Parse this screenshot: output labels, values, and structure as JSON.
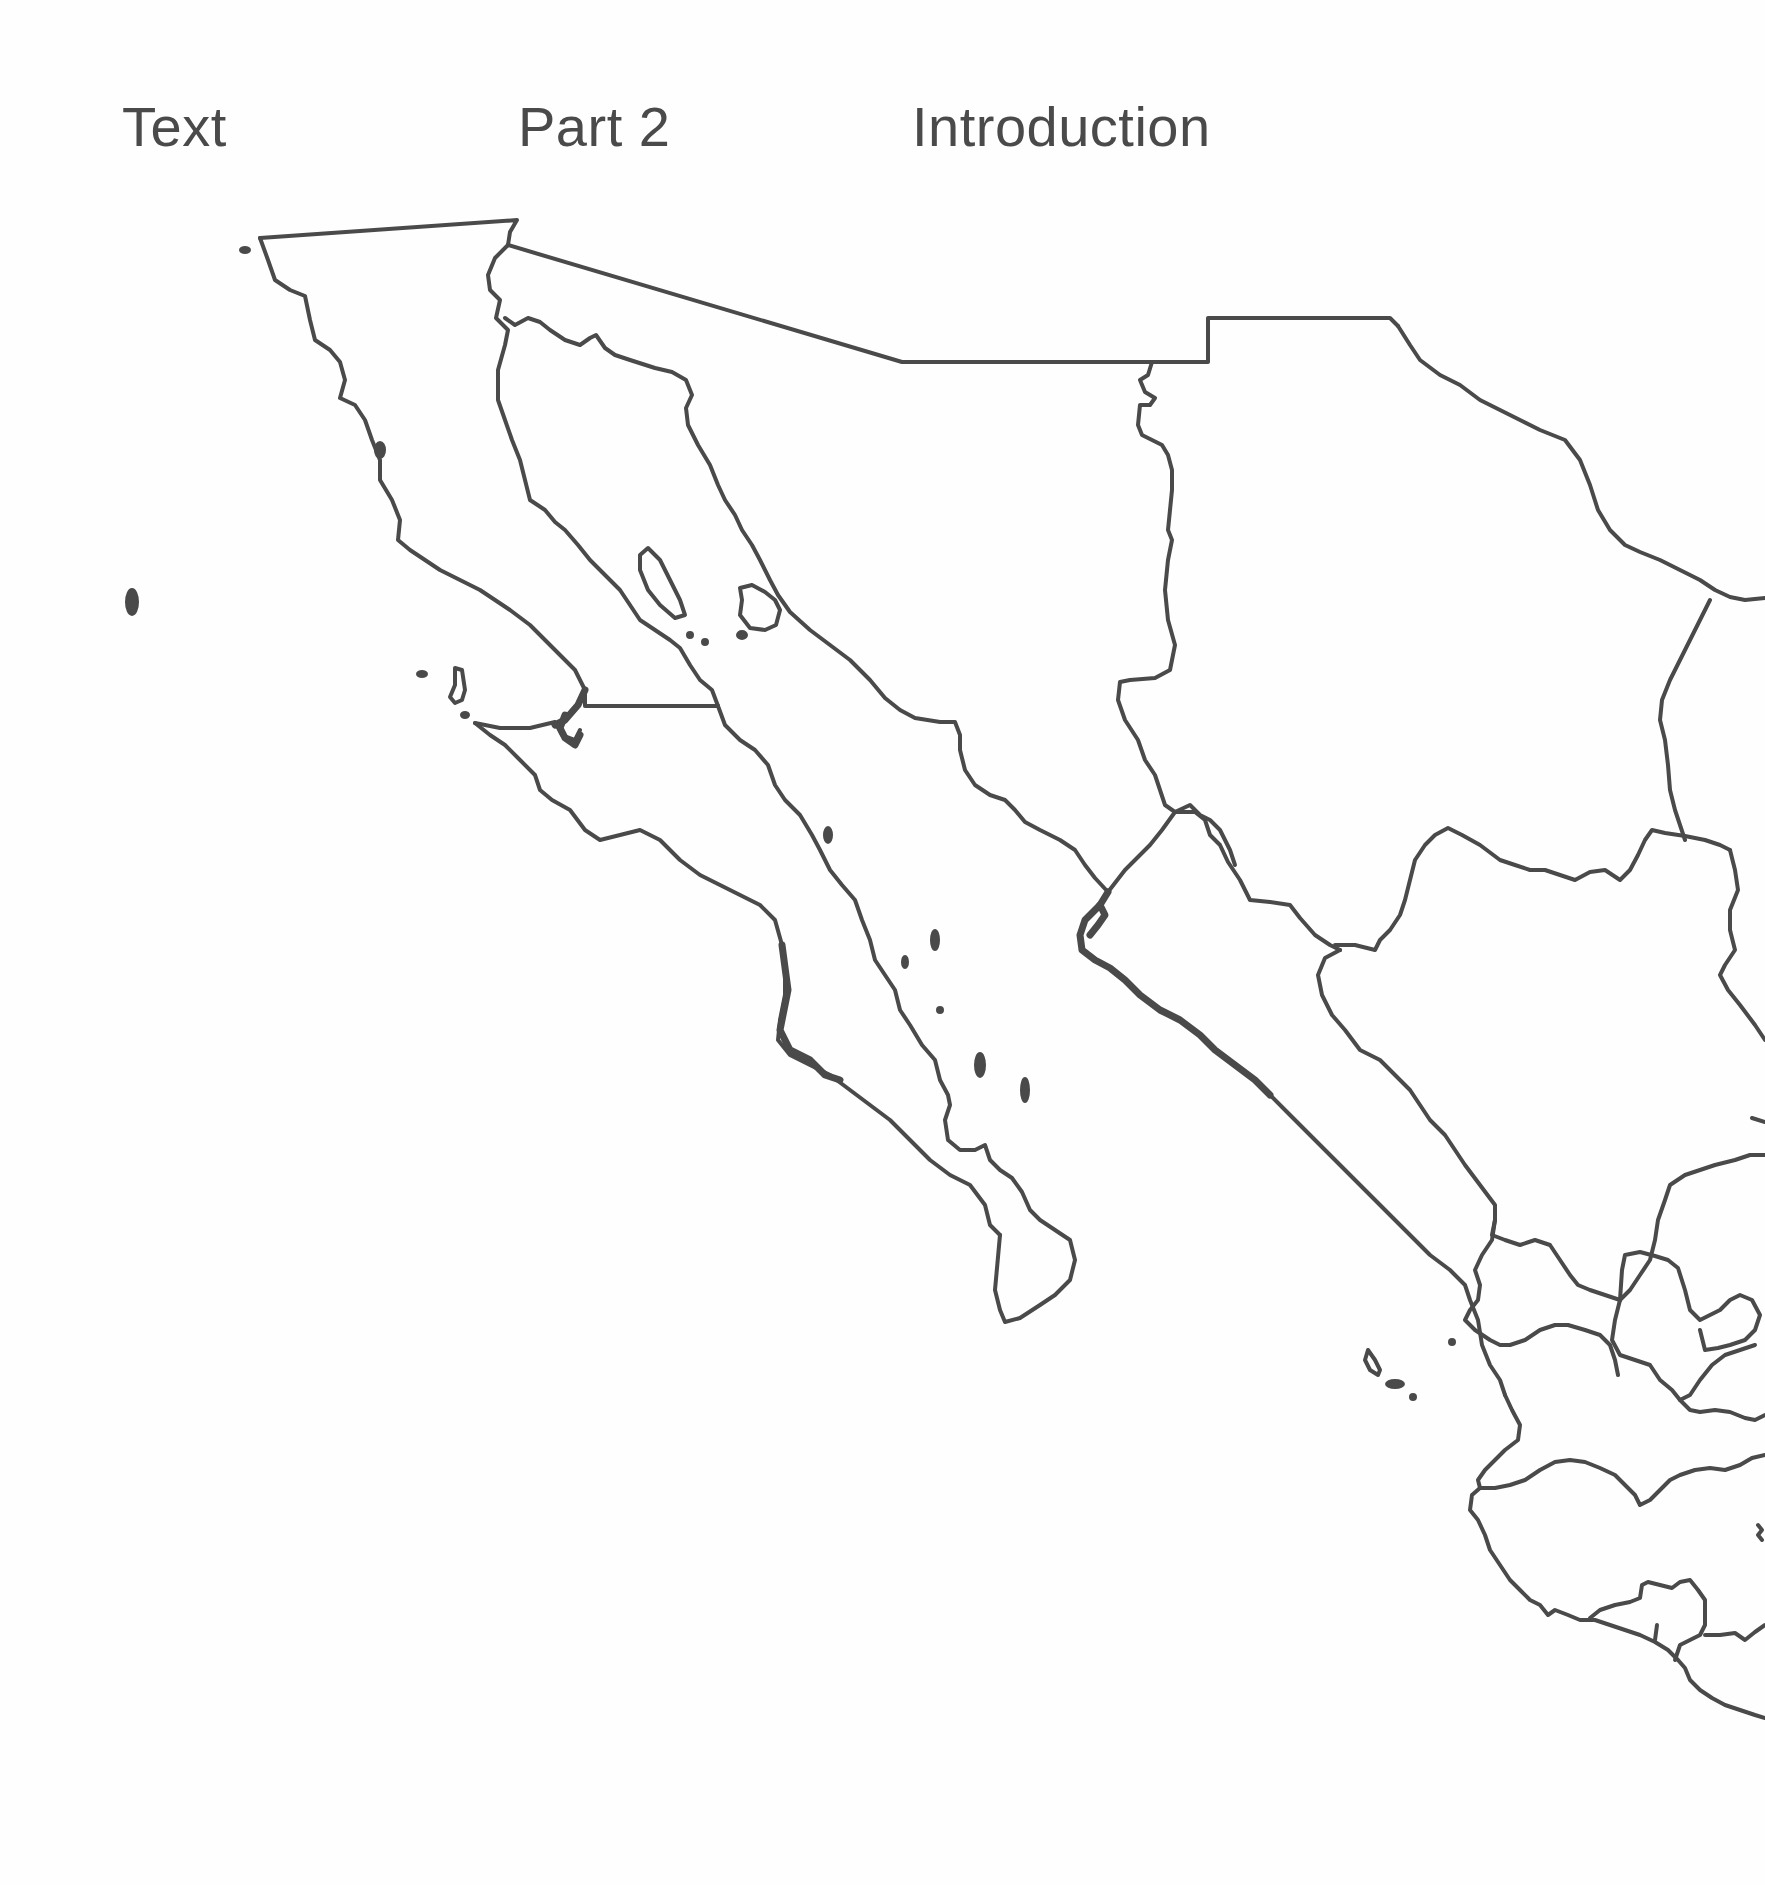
{
  "running_header": {
    "section": "Text",
    "part": "Part 2",
    "chapter": "Introduction"
  },
  "map": {
    "type": "outline-map",
    "region": "Northwestern Mexico",
    "line_color": "#4a4a4a",
    "background_color": "#ffffff",
    "features": [
      {
        "name": "baja-california",
        "kind": "state-outline"
      },
      {
        "name": "baja-california-sur",
        "kind": "state-outline"
      },
      {
        "name": "sonora",
        "kind": "state-outline"
      },
      {
        "name": "chihuahua",
        "kind": "state-outline"
      },
      {
        "name": "coahuila",
        "kind": "state-outline"
      },
      {
        "name": "sinaloa",
        "kind": "state-outline"
      },
      {
        "name": "durango",
        "kind": "state-outline"
      },
      {
        "name": "nayarit",
        "kind": "state-outline"
      },
      {
        "name": "zacatecas",
        "kind": "state-outline"
      },
      {
        "name": "jalisco",
        "kind": "state-outline"
      },
      {
        "name": "aguascalientes",
        "kind": "state-outline"
      },
      {
        "name": "colima",
        "kind": "state-outline"
      },
      {
        "name": "michoacan",
        "kind": "state-outline"
      },
      {
        "name": "us-border",
        "kind": "international-border"
      },
      {
        "name": "pacific-islands",
        "kind": "islands"
      },
      {
        "name": "gulf-of-california-islands",
        "kind": "islands"
      },
      {
        "name": "revillagigedo-tres-marias-islands",
        "kind": "islands"
      }
    ]
  }
}
